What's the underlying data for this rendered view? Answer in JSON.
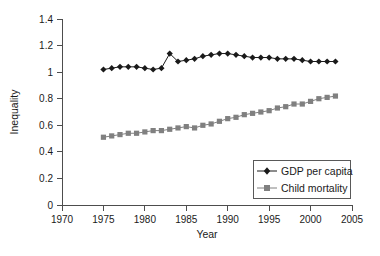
{
  "chart_data": {
    "type": "line",
    "title": "",
    "xlabel": "Year",
    "ylabel": "Inequality",
    "xlim": [
      1970,
      2005
    ],
    "ylim": [
      0,
      1.4
    ],
    "xticks": [
      1970,
      1975,
      1980,
      1985,
      1990,
      1995,
      2000,
      2005
    ],
    "xtick_labels": [
      "1970",
      "1975",
      "1980",
      "1985",
      "1990",
      "1995",
      "2000",
      "2005"
    ],
    "yticks": [
      0,
      0.2,
      0.4,
      0.6,
      0.8,
      1,
      1.2,
      1.4
    ],
    "ytick_labels": [
      "0",
      "0.2",
      "0.4",
      "0.6",
      "0.8",
      "1",
      "1.2",
      "1.4"
    ],
    "grid": false,
    "legend_position": "lower right",
    "x": [
      1975,
      1976,
      1977,
      1978,
      1979,
      1980,
      1981,
      1982,
      1983,
      1984,
      1985,
      1986,
      1987,
      1988,
      1989,
      1990,
      1991,
      1992,
      1993,
      1994,
      1995,
      1996,
      1997,
      1998,
      1999,
      2000,
      2001,
      2002,
      2003
    ],
    "series": [
      {
        "name": "GDP per capita",
        "marker": "diamond",
        "color": "#1a1a1a",
        "values": [
          1.02,
          1.03,
          1.04,
          1.04,
          1.04,
          1.03,
          1.02,
          1.03,
          1.14,
          1.08,
          1.09,
          1.1,
          1.12,
          1.13,
          1.14,
          1.14,
          1.13,
          1.12,
          1.11,
          1.11,
          1.11,
          1.1,
          1.1,
          1.1,
          1.09,
          1.08,
          1.08,
          1.08,
          1.08
        ]
      },
      {
        "name": "Child mortality",
        "marker": "square",
        "color": "#808080",
        "values": [
          0.51,
          0.52,
          0.53,
          0.54,
          0.54,
          0.55,
          0.56,
          0.56,
          0.57,
          0.58,
          0.59,
          0.58,
          0.6,
          0.61,
          0.63,
          0.65,
          0.66,
          0.68,
          0.69,
          0.7,
          0.71,
          0.73,
          0.74,
          0.76,
          0.76,
          0.78,
          0.8,
          0.81,
          0.82
        ]
      }
    ]
  },
  "legend": {
    "entries": [
      {
        "label": "GDP per capita"
      },
      {
        "label": "Child mortality"
      }
    ]
  },
  "axes": {
    "x_axis_label": "Year",
    "y_axis_label": "Inequality"
  }
}
